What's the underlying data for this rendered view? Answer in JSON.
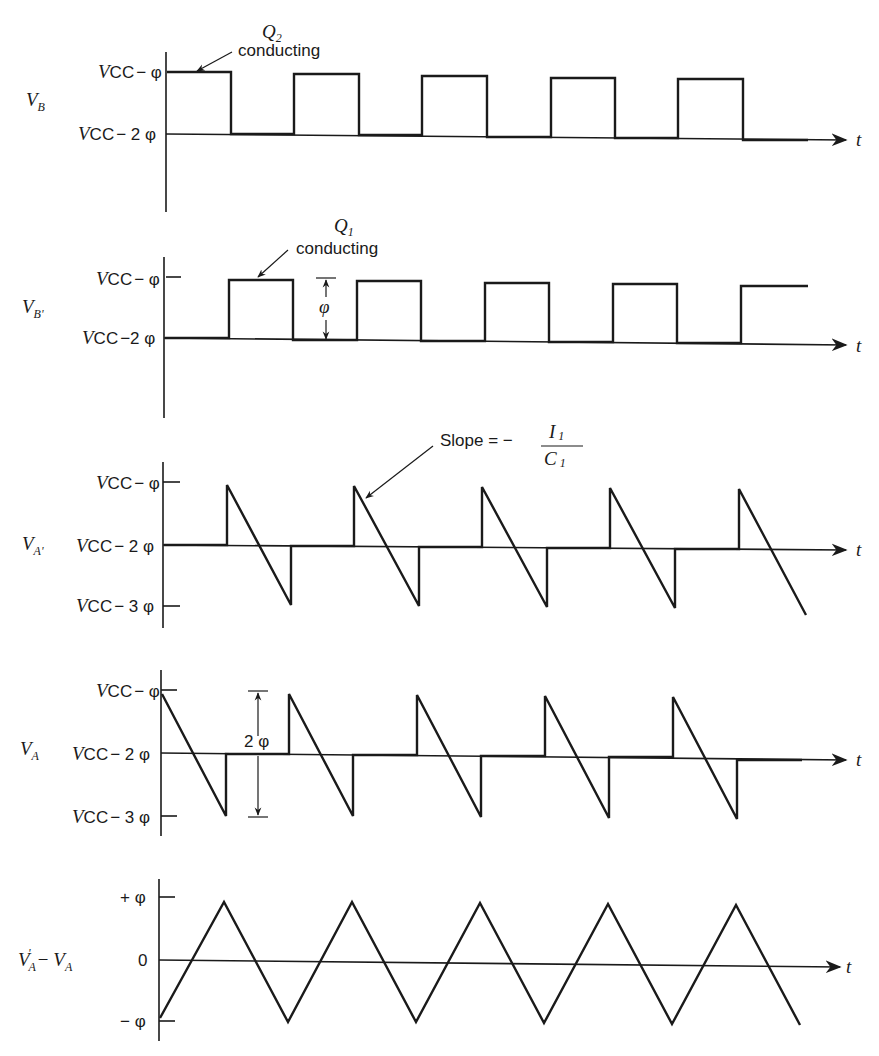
{
  "diagram": {
    "type": "timing-diagram",
    "time_label": "t",
    "panels": [
      {
        "id": "vb",
        "signal_label": "V_B",
        "signal_main": "V",
        "signal_sub": "B",
        "levels": [
          "V_CC − φ",
          "V_CC − 2φ"
        ],
        "level_top_main": "V",
        "level_top_sub": "CC",
        "level_top_rest": "− φ",
        "level_mid_main": "V",
        "level_mid_sub": "CC",
        "level_mid_rest": "− 2 φ",
        "annotation_title": "Q",
        "annotation_title_sub": "2",
        "annotation_text": "conducting",
        "waveform": "square wave starting high"
      },
      {
        "id": "vbp",
        "signal_label": "V_B'",
        "signal_main": "V",
        "signal_sub": "B'",
        "level_top_main": "V",
        "level_top_sub": "CC",
        "level_top_rest": "− φ",
        "level_mid_main": "V",
        "level_mid_sub": "CC",
        "level_mid_rest": "−2 φ",
        "annotation_title": "Q",
        "annotation_title_sub": "1",
        "annotation_text": "conducting",
        "dimension_label": "φ",
        "waveform": "square wave starting low (complement of V_B)"
      },
      {
        "id": "vap",
        "signal_label": "V_A'",
        "signal_main": "V",
        "signal_sub": "A'",
        "level_top_main": "V",
        "level_top_sub": "CC",
        "level_top_rest": "− φ",
        "level_mid_main": "V",
        "level_mid_sub": "CC",
        "level_mid_rest": "− 2 φ",
        "level_bot_main": "V",
        "level_bot_sub": "CC",
        "level_bot_rest": "− 3 φ",
        "annotation_text": "Slope = −",
        "annotation_num": "I",
        "annotation_num_sub": "1",
        "annotation_den": "C",
        "annotation_den_sub": "1",
        "waveform": "sawtooth ramps during V_B' high"
      },
      {
        "id": "va",
        "signal_label": "V_A",
        "signal_main": "V",
        "signal_sub": "A",
        "level_top_main": "V",
        "level_top_sub": "CC",
        "level_top_rest": "− φ",
        "level_mid_main": "V",
        "level_mid_sub": "CC",
        "level_mid_rest": "− 2 φ",
        "level_bot_main": "V",
        "level_bot_sub": "CC",
        "level_bot_rest": "− 3 φ",
        "dimension_label": "2 φ",
        "waveform": "sawtooth ramps during V_B high"
      },
      {
        "id": "diff",
        "signal_label": "V'_A − V_A",
        "signal_main1": "V",
        "signal_sub1": "A",
        "signal_prime": "'",
        "signal_minus": "−",
        "signal_main2": "V",
        "signal_sub2": "A",
        "level_top": "+ φ",
        "level_mid": "0",
        "level_bot": "− φ",
        "waveform": "triangle wave"
      }
    ]
  }
}
